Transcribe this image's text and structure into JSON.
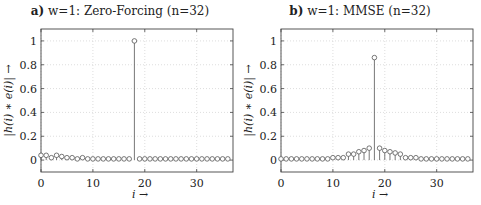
{
  "figure": {
    "panels": [
      {
        "label": "a)",
        "title_rest": "w=1: Zero-Forcing (n=32)",
        "ylabel": "|h(i) ∗ e(i)| →",
        "xlabel": "i →"
      },
      {
        "label": "b)",
        "title_rest": "w=1: MMSE (n=32)",
        "ylabel": "|h(i) ∗ e(i)| →",
        "xlabel": "i →"
      }
    ],
    "xticks": [
      "0",
      "10",
      "20",
      "30"
    ],
    "yticks": [
      "0",
      "0.2",
      "0.4",
      "0.6",
      "0.8",
      "1"
    ]
  },
  "chart_data": [
    {
      "type": "stem",
      "title": "a) w=1: Zero-Forcing (n=32)",
      "xlabel": "i →",
      "ylabel": "|h(i) * e(i)| →",
      "xlim": [
        0,
        37
      ],
      "ylim": [
        -0.1,
        1.1
      ],
      "grid": true,
      "x": [
        0,
        1,
        2,
        3,
        4,
        5,
        6,
        7,
        8,
        9,
        10,
        11,
        12,
        13,
        14,
        15,
        16,
        17,
        18,
        19,
        20,
        21,
        22,
        23,
        24,
        25,
        26,
        27,
        28,
        29,
        30,
        31,
        32,
        33,
        34,
        35,
        36
      ],
      "values": [
        0.04,
        0.04,
        0.02,
        0.04,
        0.03,
        0.02,
        0.02,
        0.01,
        0.02,
        0.01,
        0.01,
        0.01,
        0.01,
        0.01,
        0.01,
        0.01,
        0.01,
        0.01,
        1.0,
        0.01,
        0.01,
        0.01,
        0.01,
        0.01,
        0.01,
        0.01,
        0.01,
        0.01,
        0.01,
        0.01,
        0.01,
        0.01,
        0.01,
        0.01,
        0.01,
        0.01,
        0.01
      ]
    },
    {
      "type": "stem",
      "title": "b) w=1: MMSE (n=32)",
      "xlabel": "i →",
      "ylabel": "|h(i) * e(i)| →",
      "xlim": [
        0,
        37
      ],
      "ylim": [
        -0.1,
        1.1
      ],
      "grid": true,
      "x": [
        0,
        1,
        2,
        3,
        4,
        5,
        6,
        7,
        8,
        9,
        10,
        11,
        12,
        13,
        14,
        15,
        16,
        17,
        18,
        19,
        20,
        21,
        22,
        23,
        24,
        25,
        26,
        27,
        28,
        29,
        30,
        31,
        32,
        33,
        34,
        35,
        36
      ],
      "values": [
        0.01,
        0.01,
        0.01,
        0.01,
        0.01,
        0.01,
        0.01,
        0.01,
        0.01,
        0.01,
        0.02,
        0.02,
        0.02,
        0.05,
        0.05,
        0.07,
        0.08,
        0.1,
        0.86,
        0.1,
        0.08,
        0.07,
        0.06,
        0.05,
        0.02,
        0.02,
        0.02,
        0.01,
        0.01,
        0.01,
        0.01,
        0.01,
        0.01,
        0.01,
        0.01,
        0.01,
        0.01
      ]
    }
  ]
}
